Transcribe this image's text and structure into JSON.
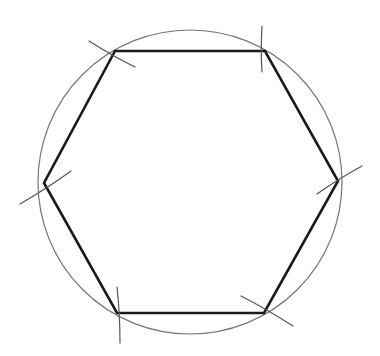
{
  "diagram": {
    "canvas": {
      "width": 380,
      "height": 356,
      "background": "#ffffff"
    },
    "circle": {
      "cx": 190,
      "cy": 182,
      "r": 152,
      "stroke": "#777777",
      "stroke_width": 1.2
    },
    "hexagon": {
      "stroke": "#1a1a1a",
      "stroke_width": 2.6,
      "vertices": [
        {
          "name": "top-left",
          "x": 115,
          "y": 51
        },
        {
          "name": "top-right",
          "x": 265,
          "y": 51
        },
        {
          "name": "right",
          "x": 338,
          "y": 181
        },
        {
          "name": "bottom-right",
          "x": 264,
          "y": 313
        },
        {
          "name": "bottom-left",
          "x": 117,
          "y": 313
        },
        {
          "name": "left",
          "x": 44,
          "y": 183
        }
      ]
    },
    "arc_marks": {
      "stroke": "#555555",
      "stroke_width": 1.2,
      "marks": [
        {
          "vertex": "top-left",
          "from": [
            89,
            41
          ],
          "to": [
            135,
            67
          ]
        },
        {
          "vertex": "top-right",
          "from": [
            262,
            26
          ],
          "to": [
            262,
            72
          ]
        },
        {
          "vertex": "right",
          "from": [
            317,
            194
          ],
          "to": [
            362,
            166
          ]
        },
        {
          "vertex": "bottom-right",
          "from": [
            241,
            296
          ],
          "to": [
            293,
            326
          ]
        },
        {
          "vertex": "bottom-left",
          "from": [
            117,
            287
          ],
          "to": [
            120,
            343
          ]
        },
        {
          "vertex": "left",
          "from": [
            20,
            204
          ],
          "to": [
            71,
            171
          ]
        }
      ]
    }
  }
}
